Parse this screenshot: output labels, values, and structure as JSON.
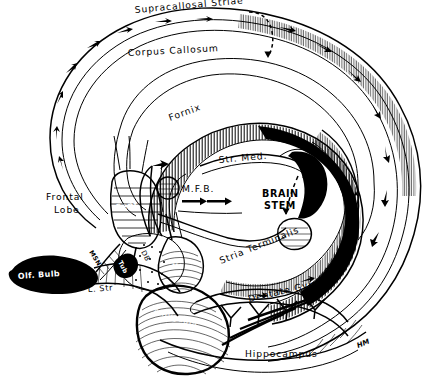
{
  "figure": {
    "medium": "black and white pen-and-ink anatomical line drawing",
    "background_color": "#ffffff",
    "ink_color": "#000000",
    "signature": "HM"
  },
  "labels": {
    "supracallosal_striae": "Supracallosal Striae",
    "corpus_callosum": "Corpus Callosum",
    "fornix": "Fornix",
    "str_med": "Str. Med.",
    "mfb": "M.F.B.",
    "brain_stem_line1": "BRAIN",
    "brain_stem_line2": "STEM",
    "frontal_lobe_line1": "Frontal",
    "frontal_lobe_line2": "Lobe",
    "sept": "Sept",
    "msn": "MSN",
    "tub": "Tub",
    "db": "DB",
    "m": "M",
    "olf_bulb": "Olf. Bulb",
    "l_str": "L. Str",
    "amygdala": "Amygdala",
    "stria_terminalis": "Stria Terminalis",
    "dentate_gyrus": "Dentate Gyrus",
    "hippocampus": "Hippocampus"
  },
  "annotations": {
    "mfb_arrow_count": 2,
    "mfb_arrow_direction": "right",
    "hippocampus_chevron_count": 4,
    "striae_arrow_direction": "clockwise along callosum",
    "dashed_leader_count": 2
  }
}
